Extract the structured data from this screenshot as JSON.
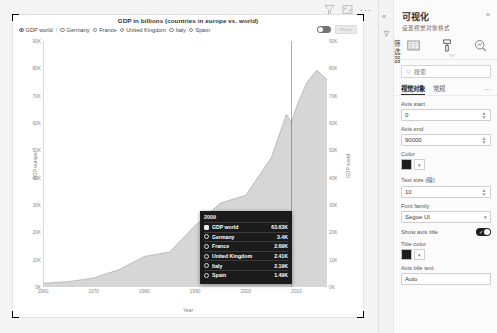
{
  "visual": {
    "title": "GDP in billions (countries in europe vs. world)",
    "toolbar": {
      "filter_icon": "filter-icon",
      "focus_icon": "focus-mode-icon",
      "more": "···"
    },
    "legend": {
      "separator": "|",
      "items": [
        {
          "label": "GDP world",
          "selected": true
        },
        {
          "label": "Germany",
          "selected": false
        },
        {
          "label": "France",
          "selected": false
        },
        {
          "label": "United Kingdom",
          "selected": false
        },
        {
          "label": "Italy",
          "selected": false
        },
        {
          "label": "Spain",
          "selected": false
        }
      ]
    },
    "toggle_label": "",
    "ghost_button_label": "Reset"
  },
  "chart_data": {
    "type": "area",
    "title": "GDP in billions (countries in europe vs. world)",
    "xlabel": "Year",
    "ylabel": "GDP europe",
    "y2label": "GDP world",
    "xlim": [
      1960,
      2016
    ],
    "ylim": [
      0,
      90000
    ],
    "y2lim": [
      0,
      90000
    ],
    "grid": false,
    "legend_position": "top",
    "yticks": [
      "0K",
      "10K",
      "20K",
      "30K",
      "40K",
      "50K",
      "60K",
      "70K",
      "80K",
      "90K"
    ],
    "ytick_values": [
      0,
      10000,
      20000,
      30000,
      40000,
      50000,
      60000,
      70000,
      80000,
      90000
    ],
    "y2ticks": [
      "0K",
      "10K",
      "20K",
      "30K",
      "40K",
      "50K",
      "60K",
      "70K",
      "80K",
      "90K"
    ],
    "xticks": [
      "1960",
      "1970",
      "1980",
      "1990",
      "2000",
      "2010"
    ],
    "xtick_values": [
      1960,
      1970,
      1980,
      1990,
      2000,
      2010
    ],
    "x": [
      1960,
      1965,
      1970,
      1975,
      1980,
      1985,
      1990,
      1995,
      2000,
      2005,
      2008,
      2009,
      2010,
      2012,
      2014,
      2016
    ],
    "series": [
      {
        "name": "GDP world",
        "values": [
          1370,
          1960,
          3330,
          6360,
          11200,
          12800,
          22500,
          30700,
          33600,
          47300,
          63100,
          60300,
          66000,
          74800,
          79300,
          75800
        ]
      }
    ],
    "highlight_year": 2009
  },
  "tooltip": {
    "year": "2009",
    "rows": [
      {
        "label": "GDP world",
        "value": "63.63K",
        "marker": "square"
      },
      {
        "label": "Germany",
        "value": "3.4K",
        "marker": "circle"
      },
      {
        "label": "France",
        "value": "2.69K",
        "marker": "circle"
      },
      {
        "label": "United Kingdom",
        "value": "2.41K",
        "marker": "circle"
      },
      {
        "label": "Italy",
        "value": "2.19K",
        "marker": "circle"
      },
      {
        "label": "Spain",
        "value": "1.49K",
        "marker": "circle"
      }
    ]
  },
  "pane": {
    "rail": {
      "collapse": "«",
      "filter_icon": "filter-pane-icon",
      "vertical_label": "筛选器"
    },
    "title": "可视化",
    "expand": "»",
    "subtitle": "设置视觉对象格式",
    "tabs": [
      {
        "name": "build-visual-tab",
        "icon": "chart-build-icon",
        "active": false
      },
      {
        "name": "format-visual-tab",
        "icon": "paint-roller-icon",
        "active": true
      },
      {
        "name": "analytics-tab",
        "icon": "magnifier-analytics-icon",
        "active": false
      }
    ],
    "search_placeholder": "搜索",
    "search_value": "",
    "subtabs": [
      {
        "label": "视觉对象",
        "active": true
      },
      {
        "label": "常规",
        "active": false
      }
    ],
    "subtab_more": "···",
    "fields": [
      {
        "name": "axis-start",
        "label": "Axis start",
        "type": "spinner",
        "value": "0"
      },
      {
        "name": "axis-end",
        "label": "Axis end",
        "type": "spinner",
        "value": "90000"
      },
      {
        "name": "color",
        "label": "Color",
        "type": "color",
        "value": "#1d1d1d"
      },
      {
        "name": "text-size",
        "label": "Text size (磅)",
        "type": "spinner",
        "value": "10"
      },
      {
        "name": "font-family",
        "label": "Font family",
        "type": "dropdown",
        "value": "Segoe UI"
      },
      {
        "name": "show-axis-title",
        "label": "Show axis title",
        "type": "switch",
        "value": "on"
      },
      {
        "name": "title-color",
        "label": "Title color",
        "type": "color",
        "value": "#1d1d1d"
      },
      {
        "name": "axis-title-text",
        "label": "Axis title text",
        "type": "text",
        "value": "Auto"
      }
    ]
  }
}
